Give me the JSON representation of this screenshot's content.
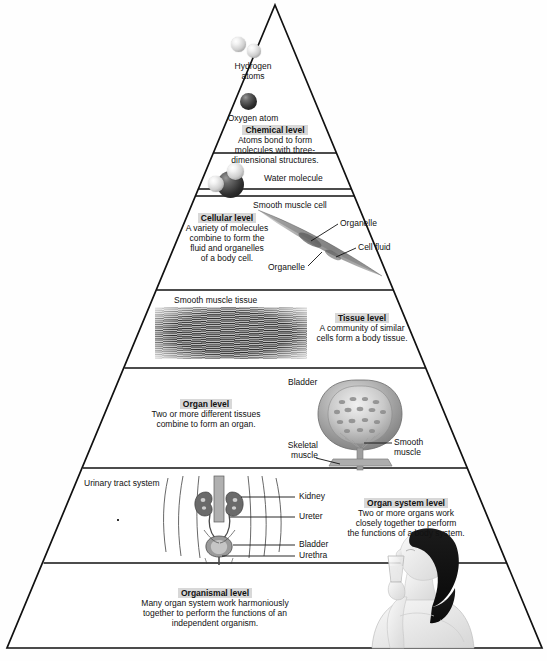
{
  "figure": {
    "type": "hierarchy-pyramid",
    "orientation": "apex-top",
    "level_count": 6
  },
  "levels": [
    {
      "id": "chemical",
      "title": "Chemical level",
      "description": "Atoms bond to form molecules with three-dimensional structures.",
      "labels": [
        "Hydrogen atoms",
        "Oxygen atom",
        "Water molecule"
      ]
    },
    {
      "id": "cellular",
      "title": "Cellular level",
      "description": "A variety of molecules combine to form the fluid and organelles of a body cell.",
      "labels": [
        "Smooth muscle cell",
        "Organelle",
        "Cell fluid",
        "Organelle"
      ]
    },
    {
      "id": "tissue",
      "title": "Tissue level",
      "description": "A community of similar cells form a body tissue.",
      "labels": [
        "Smooth muscle tissue"
      ]
    },
    {
      "id": "organ",
      "title": "Organ level",
      "description": "Two or more different tissues combine to form an organ.",
      "labels": [
        "Bladder",
        "Smooth muscle",
        "Skeletal muscle"
      ]
    },
    {
      "id": "organ-system",
      "title": "Organ system level",
      "description": "Two or more organs work closely together to perform the functions of a body system.",
      "labels": [
        "Urinary tract system",
        "Kidney",
        "Ureter",
        "Bladder",
        "Urethra"
      ]
    },
    {
      "id": "organismal",
      "title": "Organismal level",
      "description": "Many organ system work harmoniously together to perform the functions of an independent organism.",
      "labels": []
    }
  ],
  "chemical": {
    "title": "Chemical level",
    "line1": "Atoms bond to form",
    "line2": "molecules with three-",
    "line3": "dimensional structures.",
    "hydrogen_label_1": "Hydrogen",
    "hydrogen_label_2": "atoms",
    "oxygen_label": "Oxygen atom",
    "water_label": "Water molecule"
  },
  "cellular": {
    "title": "Cellular level",
    "line1": "A variety of molecules",
    "line2": "combine to form the",
    "line3": "fluid and organelles",
    "line4": "of a body cell.",
    "cell_label": "Smooth muscle cell",
    "organelle_top": "Organelle",
    "cell_fluid": "Cell fluid",
    "organelle_bottom": "Organelle"
  },
  "tissue": {
    "title": "Tissue level",
    "line1": "A community of similar",
    "line2": "cells form a body tissue.",
    "tissue_label": "Smooth muscle tissue"
  },
  "organ": {
    "title": "Organ level",
    "line1": "Two or more different tissues",
    "line2": "combine to form an organ.",
    "bladder_label": "Bladder",
    "smooth_muscle_1": "Smooth",
    "smooth_muscle_2": "muscle",
    "skeletal_muscle_1": "Skeletal",
    "skeletal_muscle_2": "muscle"
  },
  "organ_system": {
    "title": "Organ system level",
    "line1": "Two or more organs work",
    "line2": "closely together to perform",
    "line3": "the functions of a body system.",
    "system_label": "Urinary tract system",
    "kidney": "Kidney",
    "ureter": "Ureter",
    "bladder": "Bladder",
    "urethra": "Urethra"
  },
  "organismal": {
    "title": "Organismal level",
    "line1": "Many organ system work harmoniously",
    "line2": "together to perform the functions of an",
    "line3": "independent organism."
  },
  "colors": {
    "outline": "#111111",
    "page_background": "#ffffff",
    "label_highlight": "#d8d8d8",
    "artwork_gray": "#8f8f8f",
    "atom_dark": "#1c1c1c"
  }
}
